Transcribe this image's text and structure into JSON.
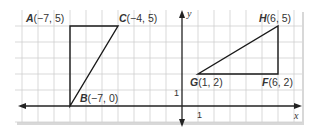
{
  "figure": {
    "type": "coordinate-grid",
    "grid_unit_px": 16,
    "axes": {
      "x_label": "x",
      "y_label": "y",
      "x_tick_label": "1",
      "y_tick_label": "1"
    },
    "points": {
      "A": {
        "name": "A",
        "coords": "(−7, 5)",
        "x": -7,
        "y": 5
      },
      "B": {
        "name": "B",
        "coords": "(−7, 0)",
        "x": -7,
        "y": 0
      },
      "C": {
        "name": "C",
        "coords": "(−4, 5)",
        "x": -4,
        "y": 5
      },
      "F": {
        "name": "F",
        "coords": "(6, 2)",
        "x": 6,
        "y": 2
      },
      "G": {
        "name": "G",
        "coords": "(1, 2)",
        "x": 1,
        "y": 2
      },
      "H": {
        "name": "H",
        "coords": "(6, 5)",
        "x": 6,
        "y": 5
      }
    },
    "triangles": [
      {
        "name": "ABC",
        "vertices": [
          "A",
          "B",
          "C"
        ]
      },
      {
        "name": "FGH",
        "vertices": [
          "F",
          "G",
          "H"
        ]
      }
    ],
    "colors": {
      "grid": "#c8c8c8",
      "axis": "#222222",
      "shape": "#1a1a1a",
      "panel": "#ffffff"
    }
  }
}
